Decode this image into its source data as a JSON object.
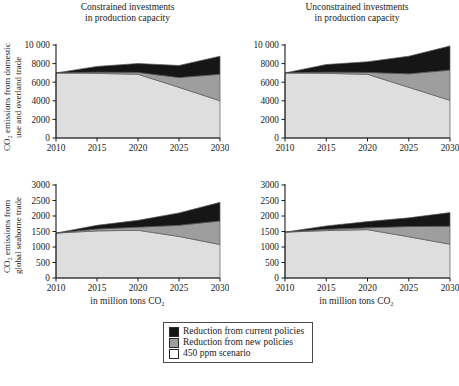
{
  "figure": {
    "xlabel": "in million tons CO₂",
    "ylabel_top": {
      "line1": "CO₂ emissions from domestic",
      "line2": "use and overland trade"
    },
    "ylabel_bottom": {
      "line1": "CO₂ emissions from",
      "line2": "global seaborne trade"
    },
    "title_left": {
      "line1": "Constrained investments",
      "line2": "in production capacity"
    },
    "title_right": {
      "line1": "Unconstrained investments",
      "line2": "in production capacity"
    }
  },
  "legend": {
    "items": [
      {
        "label": "Reduction from current policies",
        "color": "#161616",
        "swatch": "sw-black"
      },
      {
        "label": "Reduction from new policies",
        "color": "#9e9e9e",
        "swatch": "sw-gray"
      },
      {
        "label": "450 ppm scenario",
        "color": "#ffffff",
        "swatch": "sw-light"
      }
    ]
  },
  "colors": {
    "current_policies": "#161616",
    "new_policies": "#9e9e9e",
    "scenario_450": "#dedede",
    "axis": "#1a1a1a",
    "outline": "#5a5a5a"
  },
  "chart_data": [
    {
      "id": "top-left",
      "type": "area",
      "stacked": true,
      "title": "Constrained investments in production capacity",
      "xlabel": "in million tons CO₂",
      "ylabel": "CO₂ emissions from domestic use and overland trade",
      "x": [
        2010,
        2015,
        2020,
        2025,
        2030
      ],
      "xlim": [
        2010,
        2030
      ],
      "ylim": [
        0,
        10000
      ],
      "yticks": [
        0,
        2000,
        4000,
        6000,
        8000,
        10000
      ],
      "ytick_labels": [
        "0",
        "2000",
        "4000",
        "6000",
        "8000",
        "10 000"
      ],
      "xticks": [
        2010,
        2015,
        2020,
        2025,
        2030
      ],
      "xtick_labels": [
        "2010",
        "2015",
        "2020",
        "2025",
        "2030"
      ],
      "grid": false,
      "legend_position": "below-figure",
      "series": [
        {
          "name": "450 ppm scenario",
          "values": [
            7000,
            6950,
            6850,
            5450,
            4000
          ]
        },
        {
          "name": "Reduction from new policies",
          "values": [
            0,
            130,
            200,
            1050,
            2850
          ]
        },
        {
          "name": "Reduction from current policies",
          "values": [
            0,
            620,
            960,
            1300,
            1950
          ]
        }
      ],
      "cumulative_totals": [
        7000,
        7700,
        8010,
        7800,
        8800
      ]
    },
    {
      "id": "top-right",
      "type": "area",
      "stacked": true,
      "title": "Unconstrained investments in production capacity",
      "xlabel": "in million tons CO₂",
      "ylabel": "CO₂ emissions from domestic use and overland trade",
      "x": [
        2010,
        2015,
        2020,
        2025,
        2030
      ],
      "xlim": [
        2010,
        2030
      ],
      "ylim": [
        0,
        10000
      ],
      "yticks": [
        0,
        2000,
        4000,
        6000,
        8000,
        10000
      ],
      "ytick_labels": [
        "0",
        "2000",
        "4000",
        "6000",
        "8000",
        "10 000"
      ],
      "xticks": [
        2010,
        2015,
        2020,
        2025,
        2030
      ],
      "xtick_labels": [
        "2010",
        "2015",
        "2020",
        "2025",
        "2030"
      ],
      "grid": false,
      "legend_position": "below-figure",
      "series": [
        {
          "name": "450 ppm scenario",
          "values": [
            7000,
            6950,
            6850,
            5450,
            4050
          ]
        },
        {
          "name": "Reduction from new policies",
          "values": [
            0,
            130,
            200,
            1450,
            3250
          ]
        },
        {
          "name": "Reduction from current policies",
          "values": [
            0,
            820,
            1150,
            1900,
            2600
          ]
        }
      ],
      "cumulative_totals": [
        7000,
        7900,
        8200,
        8800,
        9900
      ]
    },
    {
      "id": "bottom-left",
      "type": "area",
      "stacked": true,
      "title": "Constrained investments in production capacity",
      "xlabel": "in million tons CO₂",
      "ylabel": "CO₂ emissions from global seaborne trade",
      "x": [
        2010,
        2015,
        2020,
        2025,
        2030
      ],
      "xlim": [
        2010,
        2030
      ],
      "ylim": [
        0,
        3000
      ],
      "yticks": [
        0,
        500,
        1000,
        1500,
        2000,
        2500,
        3000
      ],
      "ytick_labels": [
        "0",
        "500",
        "1000",
        "1500",
        "2000",
        "2500",
        "3000"
      ],
      "xticks": [
        2010,
        2015,
        2020,
        2025,
        2030
      ],
      "xtick_labels": [
        "2010",
        "2015",
        "2020",
        "2025",
        "2030"
      ],
      "grid": false,
      "legend_position": "below-figure",
      "series": [
        {
          "name": "450 ppm scenario",
          "values": [
            1450,
            1520,
            1540,
            1340,
            1080
          ]
        },
        {
          "name": "Reduction from new policies",
          "values": [
            0,
            60,
            100,
            360,
            760
          ]
        },
        {
          "name": "Reduction from current policies",
          "values": [
            0,
            120,
            220,
            400,
            600
          ]
        }
      ],
      "cumulative_totals": [
        1450,
        1700,
        1860,
        2100,
        2440
      ]
    },
    {
      "id": "bottom-right",
      "type": "area",
      "stacked": true,
      "title": "Unconstrained investments in production capacity",
      "xlabel": "in million tons CO₂",
      "ylabel": "CO₂ emissions from global seaborne trade",
      "x": [
        2010,
        2015,
        2020,
        2025,
        2030
      ],
      "xlim": [
        2010,
        2030
      ],
      "ylim": [
        0,
        3000
      ],
      "yticks": [
        0,
        500,
        1000,
        1500,
        2000,
        2500,
        3000
      ],
      "ytick_labels": [
        "0",
        "500",
        "1000",
        "1500",
        "2000",
        "2500",
        "3000"
      ],
      "xticks": [
        2010,
        2015,
        2020,
        2025,
        2030
      ],
      "xtick_labels": [
        "2010",
        "2015",
        "2020",
        "2025",
        "2030"
      ],
      "grid": false,
      "legend_position": "below-figure",
      "series": [
        {
          "name": "450 ppm scenario",
          "values": [
            1480,
            1530,
            1560,
            1330,
            1090
          ]
        },
        {
          "name": "Reduction from new policies",
          "values": [
            0,
            40,
            60,
            330,
            580
          ]
        },
        {
          "name": "Reduction from current policies",
          "values": [
            0,
            110,
            200,
            280,
            440
          ]
        }
      ],
      "cumulative_totals": [
        1480,
        1680,
        1820,
        1940,
        2110
      ]
    }
  ]
}
